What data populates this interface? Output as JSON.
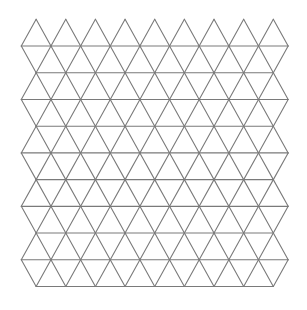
{
  "figure": {
    "background_color": "#ffffff",
    "line_color": "#7a7a7a",
    "line_width": 1.1,
    "grid": {
      "origin_x": 21.3,
      "origin_y": 19.3,
      "side": 29.65,
      "row_height": 26.72,
      "bands": 10,
      "triangles_per_wide_row": 9,
      "first_band": "wide"
    }
  }
}
